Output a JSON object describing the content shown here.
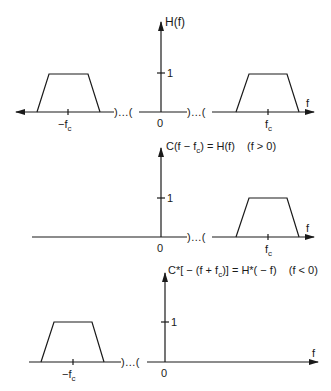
{
  "plot1": {
    "ylabel": "H(f)",
    "xlabel": "f",
    "tick_one": "1",
    "origin": "0",
    "neg_fc": "−f",
    "pos_fc": "f",
    "sub_c": "c",
    "break": ")…("
  },
  "plot2": {
    "ylabel": "C(f − f",
    "ylabel_sub": "c",
    "ylabel_rest": ") = H(f)    (f > 0)",
    "xlabel": "f",
    "tick_one": "1",
    "origin": "0",
    "pos_fc": "f",
    "sub_c": "c",
    "break": ")…("
  },
  "plot3": {
    "ylabel": "C*[ − (f + f",
    "ylabel_sub": "c",
    "ylabel_rest": ")] = H*( − f)    (f < 0)",
    "xlabel": "f",
    "tick_one": "1",
    "origin": "0",
    "neg_fc": "−f",
    "sub_c": "c",
    "break": ")…("
  },
  "colors": {
    "stroke": "#1a1a1a",
    "background": "#ffffff"
  }
}
